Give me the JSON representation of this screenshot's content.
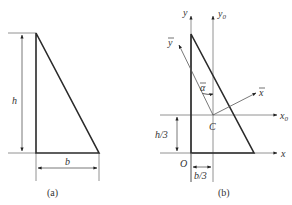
{
  "figure": {
    "panel_a": {
      "caption": "(a)",
      "height_label": "h",
      "base_label": "b"
    },
    "panel_b": {
      "caption": "(b)",
      "axis_y": "y",
      "axis_y0": "y",
      "axis_y0_sub": "0",
      "axis_x": "x",
      "axis_x0": "x",
      "axis_x0_sub": "0",
      "axis_ybar": "y",
      "axis_xbar": "x",
      "angle_label": "α",
      "centroid_label": "C",
      "origin_label": "O",
      "offset_y_label": "h/3",
      "offset_x_label": "b/3"
    },
    "colors": {
      "outline": "#2a2a2a",
      "guide": "#888888"
    }
  }
}
